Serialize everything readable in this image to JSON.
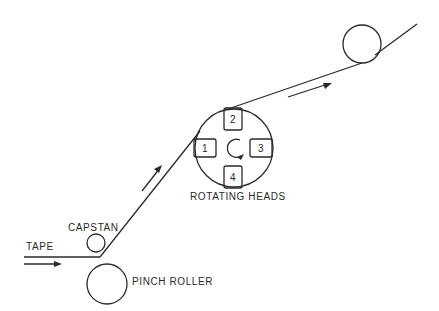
{
  "diagram": {
    "type": "tape-path-schematic",
    "labels": {
      "tape": "TAPE",
      "capstan": "CAPSTAN",
      "pinch_roller": "PINCH ROLLER",
      "rotating_heads": "ROTATING HEADS"
    },
    "heads": [
      "1",
      "2",
      "3",
      "4"
    ],
    "colors": {
      "stroke": "#2a2a2a",
      "background": "#ffffff"
    }
  }
}
